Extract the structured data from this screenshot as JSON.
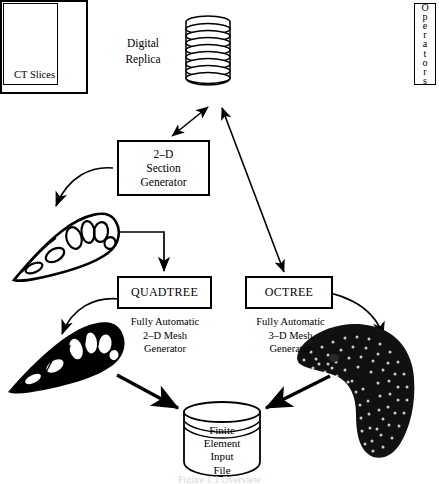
{
  "figure": {
    "caption": "Figure 1.1  Overview"
  },
  "ct_panel": {
    "slices_label": "CT  Slices",
    "operators_label": "Operators",
    "operators_letters": [
      "O",
      "p",
      "e",
      "r",
      "a",
      "t",
      "o",
      "r",
      "s"
    ],
    "side_label_line1": "Digital",
    "side_label_line2": "Replica"
  },
  "section_generator": {
    "line1": "2–D",
    "line2": "Section",
    "line3": "Generator"
  },
  "quadtree": {
    "label": "QUADTREE",
    "caption_line1": "Fully  Automatic",
    "caption_line2": "2–D  Mesh",
    "caption_line3": "Generator"
  },
  "octree": {
    "label": "OCTREE",
    "caption_line1": "Fully  Automatic",
    "caption_line2": "3–D  Mesh",
    "caption_line3": "Generator"
  },
  "output_store": {
    "line1": "Finite",
    "line2": "Element",
    "line3": "Input",
    "line4": "File"
  },
  "artwork": {
    "section_outline_name": "2-D bone section outline",
    "meshed_section_name": "2-D meshed bone section",
    "volume_mesh_name": "3-D bone surface mesh"
  },
  "colors": {
    "ink": "#000000",
    "paper": "#ffffff"
  }
}
